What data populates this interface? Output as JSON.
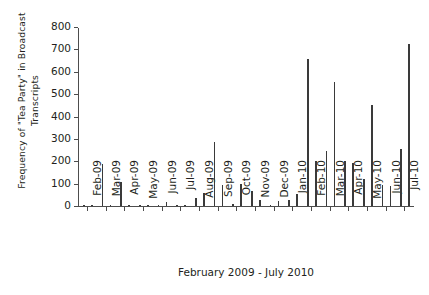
{
  "chart_data": {
    "type": "bar",
    "title": "",
    "subtitle": "",
    "xlabel": "February 2009 - July 2010",
    "ylabel": "Frequency of \"Tea Party\" in Broadcast\nTranscripts",
    "ylim": [
      0,
      800
    ],
    "yticks": [
      0,
      100,
      200,
      300,
      400,
      500,
      600,
      700,
      800
    ],
    "ytick_labels": [
      "0",
      "100",
      "200",
      "300",
      "400",
      "500",
      "600",
      "700",
      "800"
    ],
    "grid": false,
    "legend": null,
    "bar_color": "#3a3a3a",
    "axis_color": "#4d4d4d",
    "xtick_labels": [
      "Feb-09",
      "Mar-09",
      "Apr-09",
      "May-09",
      "Jun-09",
      "Jul-09",
      "Aug-09",
      "Sep-09",
      "Oct-09",
      "Nov-09",
      "Dec-09",
      "Jan-10",
      "Feb-10",
      "Mar-10",
      "Apr-10",
      "May-10",
      "Jun-10",
      "Jul-10"
    ],
    "categories": [
      "Feb-09 a",
      "Feb-09 b",
      "Mar-09 a",
      "Mar-09 b",
      "Apr-09 a",
      "Apr-09 b",
      "May-09 a",
      "May-09 b",
      "Jun-09 a",
      "Jun-09 b",
      "Jul-09 a",
      "Jul-09 b",
      "Aug-09 a",
      "Aug-09 b",
      "Sep-09 a",
      "Sep-09 b",
      "Oct-09 a",
      "Oct-09 b",
      "Nov-09 a",
      "Nov-09 b",
      "Dec-09 a",
      "Dec-09 b",
      "Jan-10 a",
      "Jan-10 b",
      "Feb-10 a",
      "Feb-10 b",
      "Mar-10 a",
      "Mar-10 b",
      "Apr-10 a",
      "Apr-10 b",
      "May-10 a",
      "May-10 b",
      "Jun-10 a",
      "Jun-10 b",
      "Jul-10 a",
      "Jul-10 b"
    ],
    "values": [
      6,
      2,
      190,
      5,
      107,
      3,
      2,
      1,
      2,
      18,
      2,
      2,
      38,
      58,
      288,
      96,
      8,
      100,
      68,
      27,
      3,
      24,
      27,
      52,
      655,
      200,
      248,
      555,
      203,
      192,
      122,
      453,
      95,
      88,
      255,
      725
    ]
  }
}
